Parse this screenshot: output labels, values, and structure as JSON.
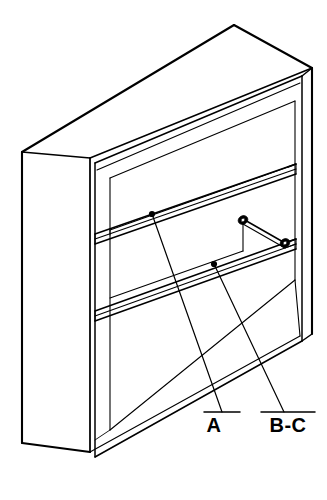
{
  "drawing": {
    "title": "Isometric cabinet assembly line drawing",
    "subject": "shelving-cabinet",
    "line_color": "#000000",
    "background_color": "#ffffff",
    "view": "isometric",
    "callouts": [
      {
        "id": "callout-a",
        "label": "A",
        "target_name": "upper-shelf",
        "dot": {
          "x": 152,
          "y": 214
        },
        "elbow": {
          "x": 222,
          "y": 412
        },
        "underline": {
          "x1": 204,
          "y1": 412,
          "x2": 240,
          "y2": 412
        },
        "text_pos": {
          "x": 214,
          "y": 432
        }
      },
      {
        "id": "callout-bc",
        "label": "B-C",
        "target_name": "lower-shelf",
        "dot": {
          "x": 214,
          "y": 264
        },
        "elbow": {
          "x": 284,
          "y": 412
        },
        "underline": {
          "x1": 261,
          "y1": 412,
          "x2": 315,
          "y2": 412
        },
        "text_pos": {
          "x": 288,
          "y": 432
        }
      }
    ],
    "parts": [
      {
        "name": "cabinet-carcass",
        "description": "Outer box with top, left side and front face"
      },
      {
        "name": "back-panel",
        "description": "Interior back panel"
      },
      {
        "name": "upper-shelf",
        "description": "Upper shelf board"
      },
      {
        "name": "lower-shelf",
        "description": "Lower shelf board"
      },
      {
        "name": "bottom-panel",
        "description": "Interior bottom panel"
      },
      {
        "name": "shelf-pin-upper",
        "description": "Shelf support pin on right side, upper"
      },
      {
        "name": "shelf-pin-lower",
        "description": "Shelf support pin on right side, lower"
      }
    ],
    "shelf_pins": [
      {
        "name": "shelf-pin-upper",
        "x": 243,
        "y": 220
      },
      {
        "name": "shelf-pin-lower",
        "x": 285,
        "y": 243
      }
    ]
  }
}
